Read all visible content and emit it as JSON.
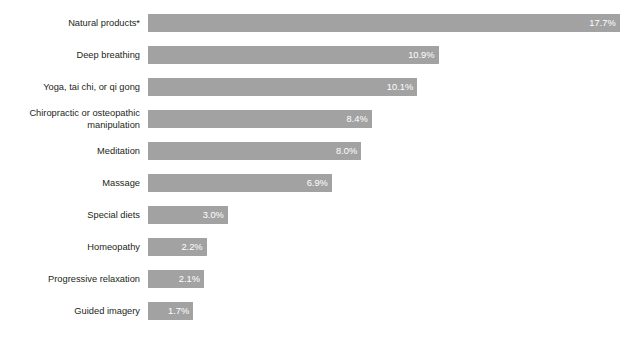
{
  "chart": {
    "title": "",
    "footnote_marker": "*"
  },
  "chart_data": {
    "type": "bar",
    "orientation": "horizontal",
    "title": "",
    "xlabel": "",
    "ylabel": "",
    "xlim": [
      0,
      18.5
    ],
    "grid": false,
    "legend": false,
    "bar_color": "#a2a2a2",
    "value_label_color": "#ffffff",
    "value_suffix": "%",
    "categories": [
      "Natural products*",
      "Deep breathing",
      "Yoga, tai chi, or qi gong",
      "Chiropractic or osteopathic\nmanipulation",
      "Meditation",
      "Massage",
      "Special diets",
      "Homeopathy",
      "Progressive relaxation",
      "Guided imagery"
    ],
    "values": [
      17.7,
      10.9,
      10.1,
      8.4,
      8.0,
      6.9,
      3.0,
      2.2,
      2.1,
      1.7
    ],
    "value_labels": [
      "17.7%",
      "10.9%",
      "10.1%",
      "8.4%",
      "8.0%",
      "6.9%",
      "3.0%",
      "2.2%",
      "2.1%",
      "1.7%"
    ]
  },
  "rows": [
    {
      "label": "Natural products*",
      "value_label": "17.7%",
      "lines": 1
    },
    {
      "label": "Deep breathing",
      "value_label": "10.9%",
      "lines": 1
    },
    {
      "label": "Yoga, tai chi, or qi gong",
      "value_label": "10.1%",
      "lines": 1
    },
    {
      "label": "Chiropractic or osteopathic\nmanipulation",
      "value_label": "8.4%",
      "lines": 2
    },
    {
      "label": "Meditation",
      "value_label": "8.0%",
      "lines": 1
    },
    {
      "label": "Massage",
      "value_label": "6.9%",
      "lines": 1
    },
    {
      "label": "Special diets",
      "value_label": "3.0%",
      "lines": 1
    },
    {
      "label": "Homeopathy",
      "value_label": "2.2%",
      "lines": 1
    },
    {
      "label": "Progressive relaxation",
      "value_label": "2.1%",
      "lines": 1
    },
    {
      "label": "Guided imagery",
      "value_label": "1.7%",
      "lines": 1
    }
  ]
}
